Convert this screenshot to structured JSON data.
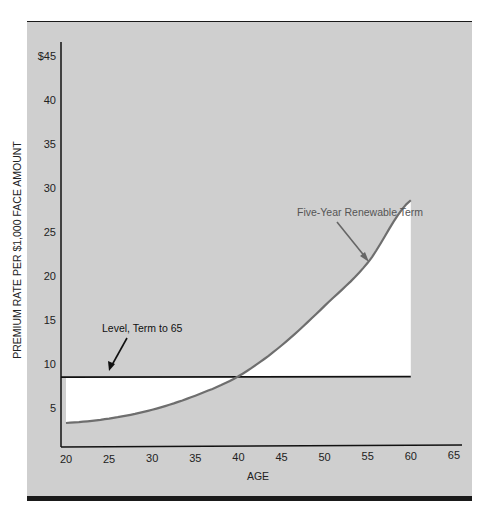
{
  "chart_data": {
    "type": "line",
    "title": "",
    "xlabel": "AGE",
    "ylabel": "PREMIUM RATE PER $1,000 FACE AMOUNT",
    "xlim": [
      20,
      65
    ],
    "ylim": [
      0,
      45
    ],
    "x_ticks": [
      "20",
      "25",
      "30",
      "35",
      "40",
      "45",
      "50",
      "55",
      "60",
      "65"
    ],
    "y_ticks": [
      "5",
      "10",
      "15",
      "20",
      "25",
      "30",
      "35",
      "40",
      "$45"
    ],
    "grid": false,
    "legend": "none (direct annotations)",
    "x": [
      20,
      25,
      30,
      35,
      40,
      45,
      50,
      55,
      60
    ],
    "series": [
      {
        "name": "Five-Year Renewable Term",
        "color": "#6e6e6e",
        "values": [
          3.3,
          3.8,
          4.8,
          6.4,
          8.6,
          12.1,
          16.6,
          21.5,
          28.6
        ]
      },
      {
        "name": "Level, Term to 65",
        "color": "#111111",
        "values": [
          8.5,
          8.5,
          8.5,
          8.5,
          8.5,
          8.5,
          8.5,
          8.5,
          8.5
        ]
      }
    ],
    "annotations": [
      {
        "text": "Five-Year Renewable Term",
        "arrow_to_age": 55
      },
      {
        "text": "Level, Term to 65",
        "arrow_to_age": 25
      }
    ],
    "shading": "Area between the two curves filled white; background gray"
  },
  "labels": {
    "xlabel": "AGE",
    "ylabel": "PREMIUM RATE PER $1,000 FACE AMOUNT",
    "ann_term": "Five-Year Renewable Term",
    "ann_level": "Level, Term to 65",
    "x_ticks": [
      "20",
      "25",
      "30",
      "35",
      "40",
      "45",
      "50",
      "55",
      "60",
      "65"
    ],
    "y_ticks": [
      "5",
      "10",
      "15",
      "20",
      "25",
      "30",
      "35",
      "40",
      "$45"
    ]
  },
  "colors": {
    "panel": "#cfcfcf",
    "rule": "#1a1a1a",
    "curve": "#6e6e6e",
    "level": "#111111",
    "fill": "#ffffff"
  }
}
